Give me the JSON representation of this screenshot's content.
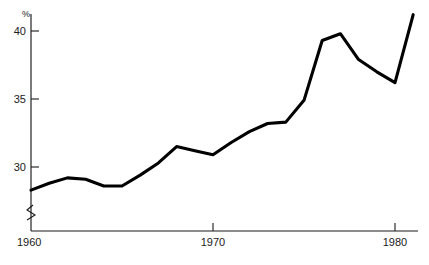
{
  "chart_data": {
    "type": "line",
    "title": "",
    "subtitle": "",
    "xlabel": "",
    "ylabel": "%",
    "ylabel_position": "top-left-of-axis",
    "grid": false,
    "legend": false,
    "legend_position": "none",
    "xlim": [
      1960,
      1981.5
    ],
    "ylim": [
      27.8,
      41.8
    ],
    "x_ticks": [
      1960,
      1970,
      1980
    ],
    "x_tick_labels": [
      "1960",
      "1970",
      "1980"
    ],
    "y_ticks": [
      30,
      35,
      40
    ],
    "y_tick_labels": [
      "30",
      "35",
      "40"
    ],
    "y_axis_break": true,
    "y_axis_break_note": "zigzag break symbol on vertical axis just above the x-axis origin",
    "line_color": "#000000",
    "line_width_px": 3.1,
    "axis_color": "#1a1a1a",
    "background_color": "#ffffff",
    "x": [
      1960,
      1961,
      1962,
      1963,
      1964,
      1965,
      1966,
      1967,
      1968,
      1969,
      1970,
      1971,
      1972,
      1973,
      1974,
      1975,
      1976,
      1977,
      1978,
      1979,
      1980,
      1981
    ],
    "values": [
      28.3,
      28.8,
      29.2,
      29.1,
      28.6,
      28.6,
      29.4,
      30.3,
      31.5,
      31.2,
      30.9,
      31.8,
      32.6,
      33.2,
      33.3,
      34.9,
      39.3,
      39.8,
      37.9,
      37.0,
      36.2,
      41.2
    ],
    "series": [
      {
        "name": "percentage",
        "values": [
          28.3,
          28.8,
          29.2,
          29.1,
          28.6,
          28.6,
          29.4,
          30.3,
          31.5,
          31.2,
          30.9,
          31.8,
          32.6,
          33.2,
          33.3,
          34.9,
          39.3,
          39.8,
          37.9,
          37.0,
          36.2,
          41.2
        ]
      }
    ],
    "annotations": []
  },
  "axis": {
    "unit_symbol": "%",
    "y_labels": [
      "40",
      "35",
      "30"
    ],
    "x_labels": [
      "1960",
      "1970",
      "1980"
    ]
  }
}
